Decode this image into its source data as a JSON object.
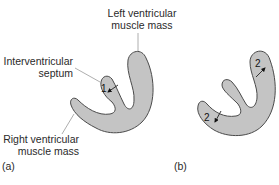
{
  "figure": {
    "panel_a": {
      "label": "(a)",
      "annotations": {
        "left_ventricular": [
          "Left ventricular",
          "muscle mass"
        ],
        "septum": [
          "Interventricular",
          "septum"
        ],
        "right_ventricular": [
          "Right ventricular",
          "muscle mass"
        ]
      },
      "thickness_markers": [
        "1"
      ]
    },
    "panel_b": {
      "label": "(b)",
      "thickness_markers": [
        "2",
        "2"
      ]
    },
    "colors": {
      "muscle_fill": "#c4c4c4",
      "outline": "#4a4a4a",
      "leader_line": "#999999",
      "text": "#2a2a2a"
    }
  }
}
